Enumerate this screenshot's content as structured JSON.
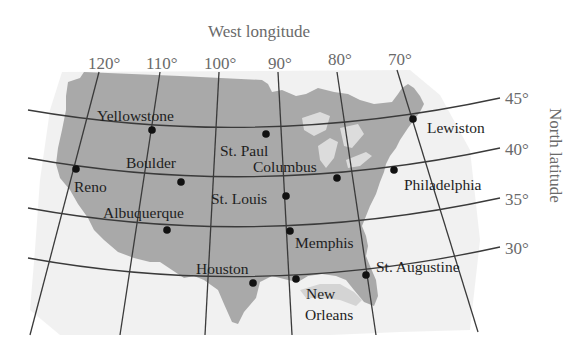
{
  "title": "West longitude",
  "right_axis_title": "North latitude",
  "longitudes": [
    {
      "label": "120°",
      "x": 99,
      "y": 85
    },
    {
      "label": "110°",
      "x": 159,
      "y": 85
    },
    {
      "label": "100°",
      "x": 219,
      "y": 85
    },
    {
      "label": "90°",
      "x": 278,
      "y": 85
    },
    {
      "label": "80°",
      "x": 341,
      "y": 82
    },
    {
      "label": "70°",
      "x": 403,
      "y": 82
    }
  ],
  "latitudes": [
    {
      "label": "45°",
      "x": 504,
      "y": 104
    },
    {
      "label": "40°",
      "x": 504,
      "y": 155
    },
    {
      "label": "35°",
      "x": 504,
      "y": 205
    },
    {
      "label": "30°",
      "x": 504,
      "y": 254
    }
  ],
  "cities": [
    {
      "name": "Yellowstone",
      "dot": [
        152,
        130
      ],
      "label": [
        97,
        122
      ]
    },
    {
      "name": "St. Paul",
      "dot": [
        266,
        133
      ],
      "label": [
        220,
        157
      ]
    },
    {
      "name": "Lewiston",
      "dot": [
        413,
        119
      ],
      "label": [
        427,
        133
      ]
    },
    {
      "name": "Reno",
      "dot": [
        76,
        169
      ],
      "label": [
        74,
        193
      ]
    },
    {
      "name": "Boulder",
      "dot": [
        181,
        182
      ],
      "label": [
        126,
        170
      ]
    },
    {
      "name": "Columbus",
      "dot": [
        337,
        178
      ],
      "label": [
        252,
        172
      ]
    },
    {
      "name": "Philadelphia",
      "dot": [
        394,
        170
      ],
      "label": [
        404,
        190
      ]
    },
    {
      "name": "St. Louis",
      "dot": [
        286,
        196
      ],
      "label": [
        211,
        204
      ]
    },
    {
      "name": "Albuquerque",
      "dot": [
        167,
        230
      ],
      "label": [
        103,
        218
      ]
    },
    {
      "name": "Memphis",
      "dot": [
        290,
        231
      ],
      "label": [
        295,
        248
      ]
    },
    {
      "name": "Houston",
      "dot": [
        253,
        283
      ],
      "label": [
        196,
        274
      ]
    },
    {
      "name": "New Orleans",
      "dot": [
        296,
        279
      ],
      "label": [
        305,
        299
      ],
      "label2": "Orleans",
      "label_line1": "New"
    },
    {
      "name": "St. Augustine",
      "dot": [
        366,
        275
      ],
      "label": [
        376,
        272
      ]
    }
  ],
  "labels": {
    "yellowstone": "Yellowstone",
    "st_paul": "St. Paul",
    "lewiston": "Lewiston",
    "reno": "Reno",
    "boulder": "Boulder",
    "columbus": "Columbus",
    "philadelphia": "Philadelphia",
    "st_louis": "St. Louis",
    "albuquerque": "Albuquerque",
    "memphis": "Memphis",
    "houston": "Houston",
    "new": "New",
    "orleans": "Orleans",
    "st_augustine": "St. Augustine"
  },
  "ticks": {
    "lon_120": "120°",
    "lon_110": "110°",
    "lon_100": "100°",
    "lon_90": "90°",
    "lon_80": "80°",
    "lon_70": "70°",
    "lat_45": "45°",
    "lat_40": "40°",
    "lat_35": "35°",
    "lat_30": "30°"
  },
  "colors": {
    "land": "#a9a9a9",
    "land_light": "#e6e6e6",
    "grid": "#3a3a3a",
    "tick_text": "#6a6a6a",
    "city_text": "#1e1e1e"
  }
}
